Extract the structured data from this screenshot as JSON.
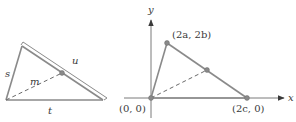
{
  "left_figure": {
    "description": "Triangle with sides s, t and a ruler-like double line along the third side u, median m dashed to midpoint",
    "labels": {
      "s": "s",
      "t": "t",
      "u": "u",
      "m": "m"
    },
    "vertices": {
      "top": [
        22,
        46
      ],
      "bottom_left": [
        6,
        100
      ],
      "bottom_right": [
        103,
        100
      ]
    },
    "midpoint": [
      62,
      73
    ]
  },
  "right_figure": {
    "description": "Coordinate plane with triangle vertices at origin, (2a, 2b), (2c, 0) and dashed median to midpoint of opposite side",
    "axis_labels": {
      "x": "x",
      "y": "y"
    },
    "point_labels": {
      "origin": "(0, 0)",
      "apex": "(2a, 2b)",
      "right": "(2c, 0)"
    },
    "points": {
      "origin": [
        151,
        98
      ],
      "apex": [
        167,
        43
      ],
      "right": [
        247,
        98
      ],
      "midpoint": [
        207,
        70
      ]
    }
  },
  "colors": {
    "line": "#8a8a8a",
    "text": "#3a3a3a",
    "background": "#ffffff"
  }
}
